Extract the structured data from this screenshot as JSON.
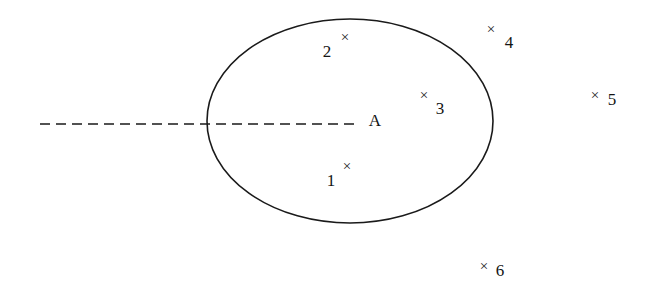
{
  "canvas": {
    "width": 648,
    "height": 290,
    "background": "#ffffff",
    "ink": "#1a1a1a"
  },
  "diagram": {
    "type": "set-region-point-diagram",
    "region": {
      "name": "region-a",
      "label": "A",
      "shape": "ellipse",
      "center_x": 350,
      "center_y": 121,
      "radius_x": 143,
      "radius_y": 102,
      "stroke": "#1a1a1a",
      "stroke_width": 1.6,
      "fill": "none",
      "label_x": 375,
      "label_y": 120
    },
    "dashed_line": {
      "name": "dashed-axis-line",
      "x_start": 40,
      "x_end": 356,
      "y": 124,
      "stroke": "#1a1a1a",
      "stroke_width": 1.6,
      "dash": "10 6"
    },
    "marker_glyph": "×",
    "points": [
      {
        "id": "1",
        "label": "1",
        "mark_x": 347,
        "mark_y": 166,
        "label_x": 331,
        "label_y": 180,
        "inside_region": true
      },
      {
        "id": "2",
        "label": "2",
        "mark_x": 345,
        "mark_y": 37,
        "label_x": 327,
        "label_y": 51,
        "inside_region": true
      },
      {
        "id": "3",
        "label": "3",
        "mark_x": 424,
        "mark_y": 95,
        "label_x": 440,
        "label_y": 108,
        "inside_region": true
      },
      {
        "id": "4",
        "label": "4",
        "mark_x": 491,
        "mark_y": 29,
        "label_x": 509,
        "label_y": 42,
        "inside_region": false
      },
      {
        "id": "5",
        "label": "5",
        "mark_x": 595,
        "mark_y": 95,
        "label_x": 612,
        "label_y": 99,
        "inside_region": false
      },
      {
        "id": "6",
        "label": "6",
        "mark_x": 484,
        "mark_y": 266,
        "label_x": 500,
        "label_y": 270,
        "inside_region": false
      }
    ]
  }
}
